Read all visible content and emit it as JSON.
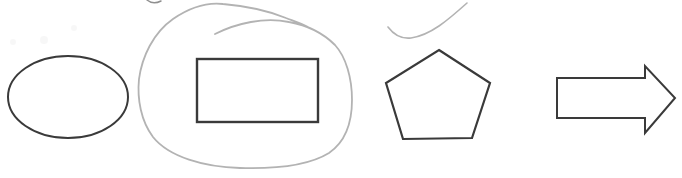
{
  "canvas": {
    "width": 682,
    "height": 178,
    "background": "#ffffff"
  },
  "colors": {
    "shape_stroke": "#3a3a3a",
    "annotation_stroke": "#b3b3b3",
    "mark_stroke": "#8f8f8f",
    "smudge_fill": "#f0f0f0"
  },
  "shapes": [
    {
      "name": "ellipse-shape",
      "type": "ellipse",
      "cx": 68,
      "cy": 97,
      "rx": 60,
      "ry": 41,
      "stroke_width": 2,
      "interactable": "true"
    },
    {
      "name": "rectangle-shape",
      "type": "rect",
      "x": 197,
      "y": 59,
      "width": 121,
      "height": 63,
      "stroke_width": 2.4,
      "interactable": "true"
    },
    {
      "name": "pentagon-shape",
      "type": "polygon",
      "points": "439,50 490,83 472,138 403,139 386,83",
      "stroke_width": 2.2,
      "interactable": "true"
    },
    {
      "name": "arrow-right-shape",
      "type": "polygon",
      "points": "557,78 645,78 645,66 675,98 645,133 645,118 557,118",
      "stroke_width": 2,
      "interactable": "true"
    }
  ],
  "annotations": [
    {
      "name": "hand-drawn-loop-annotation",
      "type": "path",
      "d": "M 215,34 C 237,23 264,17 289,22 C 306,25 323,33 335,45 C 346,57 352,78 352,100 C 352,123 345,142 329,153 C 308,166 274,169 240,168 C 204,167 169,157 153,137 C 141,121 137,99 139,79 C 142,57 153,33 173,19 C 189,8 206,2 223,4 C 246,6 269,11 286,18 C 294,21 301,23 308,27",
      "stroke_width": 1.8,
      "color_key": "annotation_stroke",
      "interactable": "false"
    },
    {
      "name": "swoosh-curve-annotation",
      "type": "path",
      "d": "M 388,27 C 394,35 402,39 411,38 C 431,35 448,20 467,3",
      "stroke_width": 1.6,
      "color_key": "annotation_stroke",
      "interactable": "false"
    },
    {
      "name": "top-edge-pen-mark",
      "type": "path",
      "d": "M 147,0 Q 153,5 161,1",
      "stroke_width": 1.5,
      "color_key": "mark_stroke",
      "interactable": "false"
    }
  ],
  "smudges": [
    {
      "name": "faint-smudge",
      "cx": 13,
      "cy": 42,
      "r": 3
    },
    {
      "name": "faint-smudge",
      "cx": 44,
      "cy": 40,
      "r": 4
    },
    {
      "name": "faint-smudge",
      "cx": 74,
      "cy": 28,
      "r": 3
    }
  ]
}
